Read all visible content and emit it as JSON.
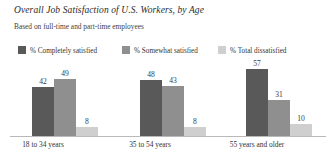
{
  "chart_data": {
    "type": "bar",
    "title": "Overall Job Satisfaction of U.S. Workers, by Age",
    "subtitle": "Based on full-time and part-time employees",
    "xlabel": "",
    "ylabel": "",
    "ylim": [
      0,
      60
    ],
    "grid": false,
    "legend_position": "top-left",
    "orientation": "vertical",
    "grouping": "grouped",
    "categories": [
      "18 to 34 years",
      "35 to 54 years",
      "55 years and older"
    ],
    "series": [
      {
        "name": "% Completely satisfied",
        "color": "#595959",
        "values": [
          42,
          48,
          57
        ]
      },
      {
        "name": "% Somewhat satisfied",
        "color": "#8f8f8f",
        "values": [
          49,
          43,
          31
        ]
      },
      {
        "name": "% Total dissatisfied",
        "color": "#cfcfcf",
        "values": [
          8,
          8,
          10
        ]
      }
    ]
  },
  "axis": {
    "baseline_color": "#b9b9b9"
  }
}
